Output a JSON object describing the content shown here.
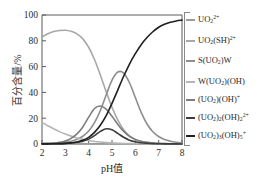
{
  "chart_data": {
    "type": "line",
    "title": "",
    "xlabel": "pH值",
    "ylabel": "百分含量/%",
    "xlim": [
      2,
      8
    ],
    "ylim": [
      0,
      100
    ],
    "xticks": [
      "2",
      "3",
      "4",
      "5",
      "6",
      "7",
      "8"
    ],
    "yticks": [
      "0",
      "20",
      "40",
      "60",
      "80",
      "100"
    ],
    "grid": false,
    "legend_position": "right",
    "x": [
      2.0,
      2.25,
      2.5,
      2.75,
      3.0,
      3.25,
      3.5,
      3.75,
      4.0,
      4.25,
      4.5,
      4.75,
      5.0,
      5.25,
      5.5,
      5.75,
      6.0,
      6.25,
      6.5,
      6.75,
      7.0,
      7.25,
      7.5,
      7.75,
      8.0
    ],
    "series": [
      {
        "name": "UO2(2+)",
        "label_html": "UO<sub>2</sub><sup>2+</sup>",
        "color": "#9a9a9a",
        "values": [
          0.6,
          0.5,
          0.5,
          0.4,
          0.4,
          0.3,
          0.3,
          0.3,
          0.2,
          0.2,
          0.2,
          0.2,
          0.1,
          0.1,
          0.1,
          0.1,
          0.1,
          0.0,
          0.0,
          0.0,
          0.0,
          0.0,
          0.0,
          0.0,
          0.0
        ]
      },
      {
        "name": "UO2(SH)2+",
        "label_html": "UO<sub>2</sub>(SH)<sup>2+</sup>",
        "color": "#a8a8a8",
        "values": [
          83.0,
          85.5,
          87.2,
          88.0,
          88.2,
          87.4,
          85.4,
          81.5,
          75.0,
          65.5,
          53.5,
          40.5,
          28.5,
          18.5,
          11.0,
          6.2,
          3.4,
          1.9,
          1.1,
          0.7,
          0.4,
          0.3,
          0.2,
          0.2,
          0.1
        ]
      },
      {
        "name": "S(UO2)W",
        "label_html": "S(UO<sub>2</sub>)W",
        "color": "#8e8e8e",
        "values": [
          0.3,
          0.4,
          0.6,
          0.9,
          1.4,
          2.2,
          3.6,
          6.0,
          10.0,
          16.5,
          26.0,
          38.0,
          49.5,
          55.8,
          55.0,
          47.5,
          36.0,
          24.5,
          15.5,
          9.5,
          5.8,
          3.5,
          2.2,
          1.4,
          0.9
        ]
      },
      {
        "name": "W(UO2)(OH)",
        "label_html": "W(UO<sub>2</sub>)(OH)",
        "color": "#b5b5b5",
        "values": [
          16.8,
          14.2,
          11.8,
          9.6,
          7.7,
          6.1,
          4.7,
          3.6,
          2.7,
          2.0,
          1.5,
          1.1,
          0.8,
          0.6,
          0.4,
          0.3,
          0.2,
          0.2,
          0.1,
          0.1,
          0.1,
          0.0,
          0.0,
          0.0,
          0.0
        ]
      },
      {
        "name": "(UO2)(OH)+",
        "label_html": "(UO<sub>2</sub>)(OH)<sup>+</sup>",
        "color": "#7d7d7d",
        "values": [
          0.2,
          0.4,
          0.7,
          1.3,
          2.4,
          4.4,
          7.8,
          13.2,
          20.8,
          27.5,
          29.5,
          27.0,
          21.5,
          15.2,
          9.8,
          6.0,
          3.6,
          2.1,
          1.3,
          0.8,
          0.5,
          0.3,
          0.2,
          0.1,
          0.1
        ]
      },
      {
        "name": "(UO2)2(OH)2(2+)",
        "label_html": "(UO<sub>2</sub>)<sub>2</sub>(OH)<sub>2</sub><sup>2+</sup>",
        "color": "#3d3d3d",
        "values": [
          0.1,
          0.1,
          0.2,
          0.3,
          0.5,
          0.8,
          1.3,
          2.2,
          3.8,
          6.5,
          9.8,
          11.8,
          11.0,
          8.2,
          5.2,
          3.0,
          1.7,
          1.0,
          0.6,
          0.3,
          0.2,
          0.1,
          0.1,
          0.1,
          0.0
        ]
      },
      {
        "name": "(UO2)3(OH)5+",
        "label_html": "(UO<sub>2</sub>)<sub>3</sub>(OH)<sub>5</sub><sup>+</sup>",
        "color": "#202020",
        "values": [
          0.1,
          0.1,
          0.2,
          0.3,
          0.5,
          0.9,
          1.6,
          2.9,
          5.2,
          9.0,
          14.5,
          22.0,
          31.5,
          42.0,
          52.5,
          62.0,
          70.0,
          77.0,
          82.5,
          87.0,
          90.5,
          92.8,
          94.4,
          95.4,
          96.0
        ]
      }
    ]
  },
  "legend": {
    "items": [
      {
        "label_html": "UO<sub>2</sub><sup>2+</sup>",
        "color": "#9a9a9a"
      },
      {
        "label_html": "UO<sub>2</sub>(SH)<sup>2+</sup>",
        "color": "#a8a8a8"
      },
      {
        "label_html": "S(UO<sub>2</sub>)W",
        "color": "#8e8e8e"
      },
      {
        "label_html": "W(UO<sub>2</sub>)(OH)",
        "color": "#b5b5b5"
      },
      {
        "label_html": "(UO<sub>2</sub>)(OH)<sup>+</sup>",
        "color": "#7d7d7d"
      },
      {
        "label_html": "(UO<sub>2</sub>)<sub>2</sub>(OH)<sub>2</sub><sup>2+</sup>",
        "color": "#3d3d3d"
      },
      {
        "label_html": "(UO<sub>2</sub>)<sub>3</sub>(OH)<sub>5</sub><sup>+</sup>",
        "color": "#202020"
      }
    ]
  }
}
